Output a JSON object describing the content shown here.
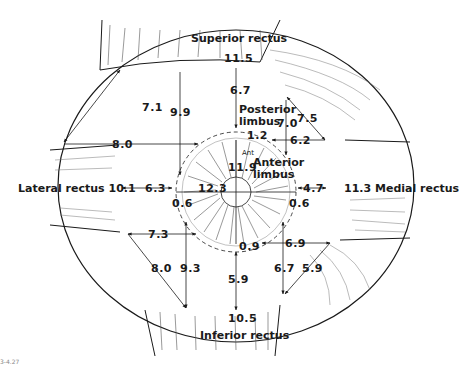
{
  "figure": {
    "label": "3-4.27"
  },
  "muscles": {
    "superior": {
      "name": "Superior rectus",
      "insertion_width": "11.5"
    },
    "inferior": {
      "name": "Inferior rectus",
      "insertion_width": "10.5"
    },
    "lateral": {
      "name": "Lateral rectus",
      "insertion_width": "10.1"
    },
    "medial": {
      "name": "Medial rectus",
      "insertion_width": "11.3"
    }
  },
  "limbus": {
    "posterior": "Posterior\nlimbus",
    "posterior_line1": "Posterior",
    "posterior_line2": "limbus",
    "anterior_line1": "Anterior",
    "anterior_line2": "limbus",
    "ant_abbrev": "Ant"
  },
  "measurements": {
    "superior_to_limbus": "6.7",
    "limbus_width_top": "1.2",
    "cornea_vertical": "11.9",
    "cornea_horizontal": "12.3",
    "lateral_to_limbus": "6.3",
    "medial_to_limbus": "4.7",
    "limbus_width_lateral": "0.6",
    "limbus_width_medial": "0.6",
    "limbus_width_bottom": "0.9",
    "inferior_to_limbus": "5.9",
    "sup_lat_diag": "7.1",
    "sup_lat_vertical": "9.9",
    "sup_lat_horizontal": "8.0",
    "sup_med_diag": "7.5",
    "sup_med_vertical": "7.0",
    "sup_med_horizontal": "6.2",
    "inf_lat_horizontal": "7.3",
    "inf_lat_diag": "8.0",
    "inf_lat_vertical": "9.3",
    "inf_med_horizontal": "6.9",
    "inf_med_vertical": "6.7",
    "inf_med_diag": "5.9"
  },
  "colors": {
    "ink": "#1a1a1a",
    "background": "#ffffff"
  }
}
